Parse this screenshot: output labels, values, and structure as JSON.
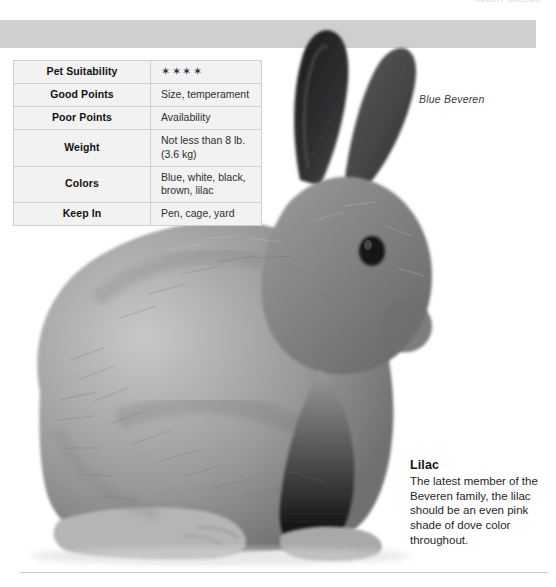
{
  "page": {
    "running_head": "RABBIT BREEDS",
    "background_color": "#ffffff",
    "banner_color": "#cfcfd1"
  },
  "photo": {
    "caption": "Blue Beveren",
    "subject": "rabbit-photograph",
    "palette": {
      "fur_light": "#b9b9ba",
      "fur_mid": "#8e8e90",
      "fur_dark": "#5c5c5e",
      "ear_dark": "#2a2a2c",
      "eye": "#141416"
    }
  },
  "table": {
    "rows": [
      {
        "label": "Pet Suitability",
        "value": "✶✶✶✶",
        "is_rating": true
      },
      {
        "label": "Good Points",
        "value": "Size, temperament",
        "is_rating": false
      },
      {
        "label": "Poor Points",
        "value": "Availability",
        "is_rating": false
      },
      {
        "label": "Weight",
        "value": "Not less than 8 lb. (3.6 kg)",
        "is_rating": false
      },
      {
        "label": "Colors",
        "value": "Blue, white, black, brown, lilac",
        "is_rating": false
      },
      {
        "label": "Keep In",
        "value": "Pen, cage, yard",
        "is_rating": false
      }
    ]
  },
  "breed_note": {
    "title": "Lilac",
    "body": "The latest member of the Beveren family, the lilac should be an even pink shade of dove color throughout."
  }
}
